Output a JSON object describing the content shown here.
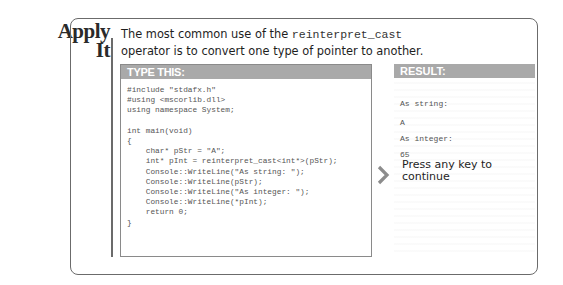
{
  "section_title": {
    "line1": "Apply",
    "line2": "It"
  },
  "intro": {
    "before": "The most common use of the ",
    "code": "reinterpret_cast",
    "after": "operator is to convert one type of pointer to another."
  },
  "type_this": {
    "header": "TYPE THIS:",
    "code_lines": [
      "#include \"stdafx.h\"",
      "#using <mscorlib.dll>",
      "using namespace System;",
      "",
      "int main(void)",
      "{",
      "    char* pStr = \"A\";",
      "    int* pInt = reinterpret_cast<int*>(pStr);",
      "    Console::WriteLine(\"As string: \");",
      "    Console::WriteLine(pStr);",
      "    Console::WriteLine(\"As integer: \");",
      "    Console::WriteLine(*pInt);",
      "    return 0;",
      "}"
    ]
  },
  "result": {
    "header": "RESULT:",
    "output_lines": [
      "As string:",
      "A",
      "As integer:",
      "65"
    ],
    "press_key": "Press any key to continue"
  },
  "icons": {
    "arrow": "chevron-right-icon"
  }
}
